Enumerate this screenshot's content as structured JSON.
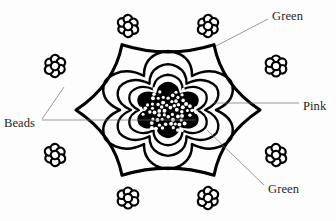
{
  "figure": {
    "kind": "beaded-doily-line-drawing",
    "background_color": "#fdfdfd",
    "ink_color": "#000000",
    "leader_color": "#6d6a68",
    "center": {
      "cx": 168,
      "cy": 110
    },
    "rings": [
      {
        "name": "outer-star-ring",
        "points": 6,
        "outer_radius": 92,
        "inner_radius": 62,
        "stroke_width": 3.1
      },
      {
        "name": "second-star-ring",
        "points": 6,
        "outer_radius": 72,
        "inner_radius": 48,
        "stroke_width": 2.5
      },
      {
        "name": "third-star-ring",
        "points": 6,
        "outer_radius": 56,
        "inner_radius": 37,
        "stroke_width": 2.4
      },
      {
        "name": "fourth-star-ring",
        "points": 6,
        "outer_radius": 43,
        "inner_radius": 29,
        "stroke_width": 2.3
      },
      {
        "name": "inner-beaded-core",
        "points": 6,
        "outer_radius": 33,
        "inner_radius": 21,
        "stroke_width": 2.2,
        "fill": "#000000"
      }
    ],
    "bead_clusters": [
      {
        "name": "bead-cluster-top-left",
        "x": 128,
        "y": 26,
        "angle": 240
      },
      {
        "name": "bead-cluster-top-right",
        "x": 208,
        "y": 26,
        "angle": 300
      },
      {
        "name": "bead-cluster-right-upper",
        "x": 276,
        "y": 66,
        "angle": 0
      },
      {
        "name": "bead-cluster-right-lower",
        "x": 276,
        "y": 155,
        "angle": 60
      },
      {
        "name": "bead-cluster-bottom-right",
        "x": 208,
        "y": 198,
        "angle": 120
      },
      {
        "name": "bead-cluster-bottom-left",
        "x": 128,
        "y": 198,
        "angle": 180
      },
      {
        "name": "bead-cluster-left-lower",
        "x": 55,
        "y": 155,
        "angle": 240
      },
      {
        "name": "bead-cluster-left-upper",
        "x": 55,
        "y": 66,
        "angle": 300
      }
    ],
    "core_beads_count": 96
  },
  "annotations": [
    {
      "id": "green-top",
      "label": "Green",
      "text_x": 272,
      "text_y": 17,
      "leader": "M 268 19 L 216 46"
    },
    {
      "id": "pink-right",
      "label": "Pink",
      "text_x": 303,
      "text_y": 107,
      "leader": "M 299 103 L 214 103"
    },
    {
      "id": "green-bottom",
      "label": "Green",
      "text_x": 268,
      "text_y": 190,
      "leader": "M 264 185 L 207 130"
    },
    {
      "id": "beads-left",
      "label": "Beads",
      "text_x": 4,
      "text_y": 124,
      "leader_primary": "M 42 120 L 196 120",
      "leader_secondary": "M 42 119 L 64 87"
    }
  ]
}
